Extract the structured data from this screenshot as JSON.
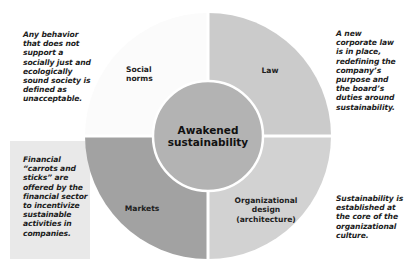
{
  "diagram": {
    "center": {
      "title": "Awakened\nsustainability",
      "color": "#b3b3b3"
    },
    "quadrants": [
      {
        "position": "top-left",
        "label": "Social\nnorms",
        "color": "#fdfdfd"
      },
      {
        "position": "top-right",
        "label": "Law",
        "color": "#cbcbcb"
      },
      {
        "position": "bottom-left",
        "label": "Markets",
        "color": "#a2a2a2"
      },
      {
        "position": "bottom-right",
        "label": "Organizational\ndesign\n(architecture)",
        "color": "#d2d2d2"
      }
    ],
    "notes": [
      {
        "position": "top-left",
        "text": "Any behavior\nthat does not\nsupport a\nsocially just and\necologically\nsound society is\ndefined as\nunacceptable."
      },
      {
        "position": "top-right",
        "text": "A new\ncorporate law\nis in place,\nredefining the\ncompany’s\npurpose and\nthe board’s\nduties around\nsustainability."
      },
      {
        "position": "bottom-left",
        "text": "Financial\n“carrots and\nsticks” are\noffered by the\nfinancial sector\nto incentivize\nsustainable\nactivities in\ncompanies."
      },
      {
        "position": "bottom-right",
        "text": "Sustainability is\nestablished at\nthe core of the\norganizational\nculture."
      }
    ],
    "colors": {
      "background": "#ffffff",
      "note_box": "#e9e9e9",
      "divider": "#ffffff"
    }
  }
}
